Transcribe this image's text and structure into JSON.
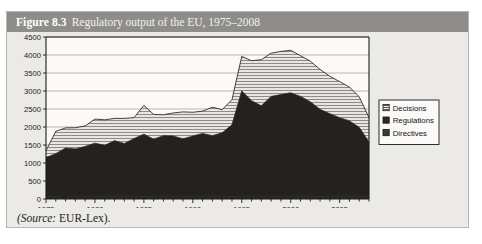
{
  "figure": {
    "number": "Figure 8.3",
    "caption": "Regulatory output of the EU, 1975–2008",
    "source_label": "(Source:",
    "source_value": " EUR-Lex).",
    "title_bar_color": "#8f8d8a",
    "panel_color": "#eceae6"
  },
  "chart_data": {
    "type": "area",
    "stacked": true,
    "title": "Regulatory output of the EU, 1975–2008",
    "xlabel": "",
    "ylabel": "",
    "xlim": [
      1975,
      2008
    ],
    "ylim": [
      0,
      4500
    ],
    "yticks": [
      0,
      500,
      1000,
      1500,
      2000,
      2500,
      3000,
      3500,
      4000,
      4500
    ],
    "ytick_labels": [
      "0",
      "500",
      "1000",
      "1500",
      "2000",
      "2500",
      "3000",
      "3500",
      "4000",
      "4500"
    ],
    "xticks": [
      1975,
      1980,
      1985,
      1990,
      1995,
      2000,
      2005
    ],
    "xtick_labels": [
      "1975",
      "1980",
      "1985",
      "1990",
      "1995",
      "2000",
      "2005"
    ],
    "minor_xticks_every": 1,
    "grid": "horizontal",
    "legend_position": "right",
    "x": [
      1975,
      1976,
      1977,
      1978,
      1979,
      1980,
      1981,
      1982,
      1983,
      1984,
      1985,
      1986,
      1987,
      1988,
      1989,
      1990,
      1991,
      1992,
      1993,
      1994,
      1995,
      1996,
      1997,
      1998,
      1999,
      2000,
      2001,
      2002,
      2003,
      2004,
      2005,
      2006,
      2007,
      2008
    ],
    "series": [
      {
        "name": "Directives",
        "fill": "#2e2c2b",
        "pattern": "solid-dark",
        "values": [
          60,
          60,
          55,
          60,
          60,
          60,
          60,
          60,
          60,
          60,
          60,
          60,
          60,
          60,
          60,
          60,
          60,
          60,
          60,
          60,
          60,
          60,
          60,
          60,
          60,
          60,
          60,
          60,
          60,
          60,
          60,
          60,
          60,
          60
        ]
      },
      {
        "name": "Regulations",
        "fill": "#232221",
        "pattern": "solid-dark",
        "values": [
          1090,
          1200,
          1360,
          1330,
          1400,
          1490,
          1430,
          1560,
          1480,
          1620,
          1740,
          1600,
          1700,
          1690,
          1610,
          1690,
          1760,
          1700,
          1780,
          2000,
          2940,
          2670,
          2530,
          2790,
          2840,
          2890,
          2790,
          2640,
          2430,
          2310,
          2200,
          2110,
          1930,
          1520
        ]
      },
      {
        "name": "Decisions",
        "fill": "#d8d6d2",
        "pattern": "horizontal-hatch",
        "values": [
          190,
          620,
          560,
          590,
          570,
          670,
          710,
          620,
          700,
          580,
          800,
          690,
          580,
          640,
          750,
          660,
          620,
          790,
          640,
          700,
          960,
          1110,
          1280,
          1200,
          1200,
          1180,
          1130,
          1130,
          1110,
          1040,
          1000,
          940,
          850,
          680
        ]
      }
    ],
    "legend": [
      {
        "label": "Decisions",
        "swatch": "hatch-light"
      },
      {
        "label": "Regulations",
        "swatch": "solid-black"
      },
      {
        "label": "Directives",
        "swatch": "solid-gray"
      }
    ]
  }
}
